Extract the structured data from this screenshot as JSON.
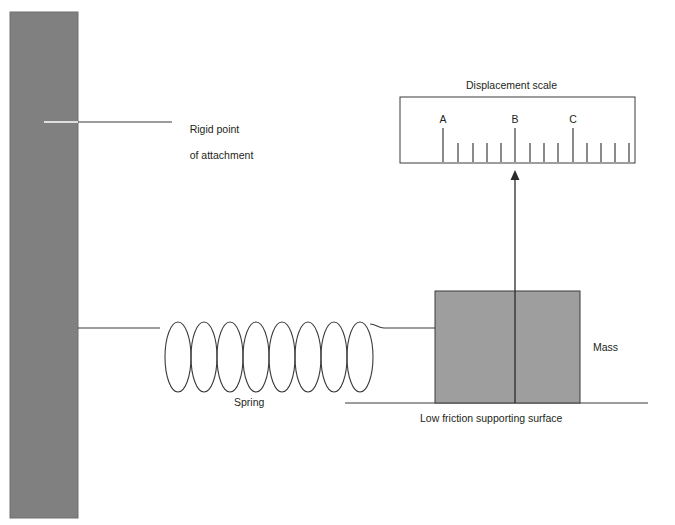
{
  "figure": {
    "title_label": "Displacement scale",
    "labels": {
      "rigid_point_line1": "Rigid point",
      "rigid_point_line2": "of attachment",
      "spring": "Spring",
      "mass": "Mass",
      "surface": "Low friction supporting surface"
    },
    "colors": {
      "wall_fill": "#808080",
      "mass_fill": "#9e9e9e",
      "stroke": "#3b3b3b",
      "text": "#231f20",
      "background": "#ffffff",
      "leader_inner": "#ffffff"
    },
    "wall": {
      "x": 10,
      "y": 12,
      "width": 68,
      "height": 506
    },
    "spring": {
      "coils": 8,
      "start_x": 78,
      "end_x": 435,
      "baseline_y": 328,
      "coil_left": 160,
      "coil_right": 366,
      "coil_top": 322,
      "coil_bottom": 392,
      "coil_width": 26
    },
    "mass": {
      "x": 435,
      "y": 291,
      "width": 145,
      "height": 112
    },
    "surface": {
      "x1": 345,
      "x2": 648,
      "y": 403
    },
    "pointer": {
      "x": 515,
      "top_y": 172,
      "bottom_y": 403,
      "arrow_half_width": 4,
      "arrow_height": 9
    },
    "scale_box": {
      "x": 400,
      "y": 97,
      "width": 235,
      "height": 66
    },
    "scale": {
      "baseline_y": 162,
      "major_tick_top": 128,
      "minor_tick_top": 143,
      "major_ticks": [
        {
          "label": "A",
          "x": 443
        },
        {
          "label": "B",
          "x": 515
        },
        {
          "label": "C",
          "x": 573
        }
      ],
      "minor_ticks_x": [
        458,
        473,
        487,
        501,
        530,
        544,
        558,
        587,
        601,
        615,
        629
      ],
      "label_y": 113
    },
    "leader": {
      "x1": 44,
      "x2": 172,
      "y": 122,
      "inner_x2": 78
    },
    "text_positions": {
      "rigid_point": {
        "x": 178,
        "y": 110
      },
      "spring": {
        "x": 234,
        "y": 397
      },
      "mass": {
        "x": 593,
        "y": 341
      },
      "surface": {
        "x": 420,
        "y": 412
      },
      "displacement_scale": {
        "x": 465,
        "y": 79
      }
    }
  }
}
